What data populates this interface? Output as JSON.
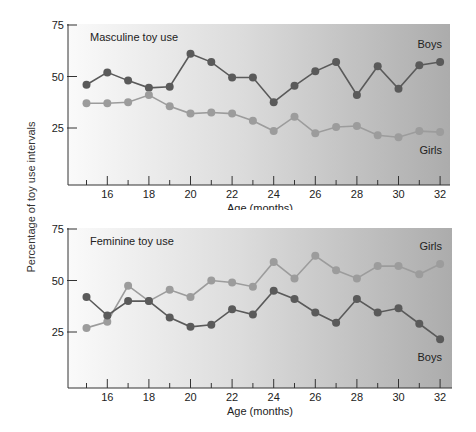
{
  "figure": {
    "ylabel": "Percentage of toy use intervals"
  },
  "chart_data": [
    {
      "type": "line",
      "title": "Masculine toy use",
      "xlabel": "Age (months)",
      "ylabel": "Percentage of toy use intervals",
      "x": [
        15,
        16,
        17,
        18,
        19,
        20,
        21,
        22,
        23,
        24,
        25,
        26,
        27,
        28,
        29,
        30,
        31,
        32
      ],
      "xticks": [
        16,
        18,
        20,
        22,
        24,
        26,
        28,
        30,
        32
      ],
      "yticks": [
        25,
        50,
        75
      ],
      "ylim": [
        0,
        75
      ],
      "xlim": [
        14,
        32.5
      ],
      "grid": false,
      "series": [
        {
          "name": "Boys",
          "color": "#5a5a5a",
          "values": [
            46,
            52,
            48,
            44.5,
            45,
            61,
            57,
            49.5,
            49.5,
            37.5,
            45.5,
            52.5,
            57,
            41,
            55,
            44,
            55.5,
            57
          ]
        },
        {
          "name": "Girls",
          "color": "#9c9c9c",
          "values": [
            37,
            37,
            37.5,
            41,
            35.5,
            32,
            32.5,
            32,
            28.5,
            23.5,
            30.5,
            22.5,
            25.5,
            26,
            21.5,
            20.5,
            23.5,
            23
          ]
        }
      ],
      "series_labels": {
        "Boys": "Boys",
        "Girls": "Girls"
      }
    },
    {
      "type": "line",
      "title": "Feminine toy use",
      "xlabel": "Age (months)",
      "ylabel": "Percentage of toy use intervals",
      "x": [
        15,
        16,
        17,
        18,
        19,
        20,
        21,
        22,
        23,
        24,
        25,
        26,
        27,
        28,
        29,
        30,
        31,
        32
      ],
      "xticks": [
        16,
        18,
        20,
        22,
        24,
        26,
        28,
        30,
        32
      ],
      "yticks": [
        25,
        50,
        75
      ],
      "ylim": [
        0,
        75
      ],
      "xlim": [
        14,
        32.5
      ],
      "grid": false,
      "series": [
        {
          "name": "Girls",
          "color": "#9c9c9c",
          "values": [
            27,
            30,
            47.5,
            40,
            45.5,
            42,
            50,
            49,
            47,
            59,
            51,
            62,
            55,
            51,
            57,
            57,
            53,
            58
          ]
        },
        {
          "name": "Boys",
          "color": "#5a5a5a",
          "values": [
            42,
            33,
            40,
            40,
            32,
            27.5,
            28.5,
            36,
            33.5,
            45,
            41,
            34.5,
            29.5,
            41,
            34.5,
            36.5,
            29,
            21.5
          ]
        }
      ],
      "series_labels": {
        "Girls": "Girls",
        "Boys": "Boys"
      }
    }
  ]
}
